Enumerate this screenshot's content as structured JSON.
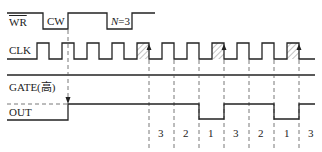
{
  "signals": {
    "wr": {
      "label": "WR"
    },
    "clk": {
      "label": "CLK"
    },
    "gate": {
      "label": "GATE(高)"
    },
    "out": {
      "label": "OUT"
    }
  },
  "annotations": {
    "cw": "CW",
    "n_prefix": "N",
    "n_value": "=3"
  },
  "counts": [
    "3",
    "2",
    "1",
    "3",
    "2",
    "1",
    "3"
  ],
  "colors": {
    "line": "#222222",
    "dash": "#555555",
    "hatch": "#888888"
  }
}
